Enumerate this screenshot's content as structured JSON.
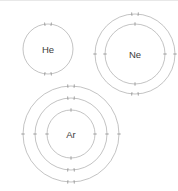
{
  "figure": {
    "title": "",
    "background_color": "#ffffff",
    "shell_color": "#a9a9a9",
    "electron_color": "#8a8a8a",
    "label_color": "#3c3c3c"
  },
  "atoms": [
    {
      "symbol": "He",
      "name": "helium",
      "center_x": 48,
      "center_y": 49,
      "shells": [
        {
          "radius": 25,
          "electrons": 2,
          "pair_positions": [
            "top",
            "bottom"
          ],
          "single_positions": []
        }
      ],
      "electron_configuration": "2"
    },
    {
      "symbol": "Ne",
      "name": "neon",
      "center_x": 135,
      "center_y": 54,
      "shells": [
        {
          "radius": 30,
          "electrons": 2,
          "pair_positions": [],
          "single_positions": [
            "top",
            "bottom",
            "left",
            "right"
          ]
        },
        {
          "radius": 40,
          "electrons": 8,
          "pair_positions": [
            "top",
            "bottom"
          ],
          "single_positions": [
            "left",
            "right"
          ]
        }
      ],
      "electron_configuration": "2,8"
    },
    {
      "symbol": "Ar",
      "name": "argon",
      "center_x": 71,
      "center_y": 134,
      "shells": [
        {
          "radius": 24,
          "electrons": 2,
          "pair_positions": [],
          "single_positions": [
            "top",
            "bottom",
            "left",
            "right"
          ]
        },
        {
          "radius": 36,
          "electrons": 8,
          "pair_positions": [
            "top",
            "bottom"
          ],
          "single_positions": [
            "left",
            "right"
          ]
        },
        {
          "radius": 48,
          "electrons": 8,
          "pair_positions": [
            "top",
            "bottom"
          ],
          "single_positions": [
            "left",
            "right"
          ]
        }
      ],
      "electron_configuration": "2,8,8"
    }
  ]
}
